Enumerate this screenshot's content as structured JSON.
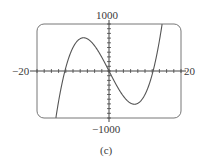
{
  "chart_data": {
    "type": "line",
    "title": "",
    "caption": "(c)",
    "function": "y = x^3 - 150x",
    "xlim": [
      -20,
      20
    ],
    "ylim": [
      -1000,
      1000
    ],
    "x_tick_labels": {
      "left": "−20",
      "right": "20"
    },
    "y_tick_labels": {
      "top": "1000",
      "bottom": "−1000"
    },
    "x_minor_ticks": 20,
    "y_minor_ticks": 20,
    "grid": false,
    "frame": "rounded-rectangle",
    "series": [
      {
        "name": "cubic",
        "x": [
          -15.4,
          -14,
          -12.25,
          -10,
          -7.07,
          -5,
          -2.5,
          0,
          2.5,
          5,
          7.07,
          10,
          12.25,
          14,
          15.3
        ],
        "y": [
          -1000,
          -644,
          0,
          500,
          707,
          625,
          359,
          0,
          -359,
          -625,
          -707,
          -500,
          0,
          644,
          1000
        ]
      }
    ],
    "features": {
      "roots": [
        -12.25,
        0,
        12.25
      ],
      "local_max": [
        -7.07,
        707
      ],
      "local_min": [
        7.07,
        -707
      ]
    }
  },
  "colors": {
    "curve": "#555555",
    "axes": "#444444",
    "frame": "#777777",
    "text": "#3a3a3a"
  }
}
